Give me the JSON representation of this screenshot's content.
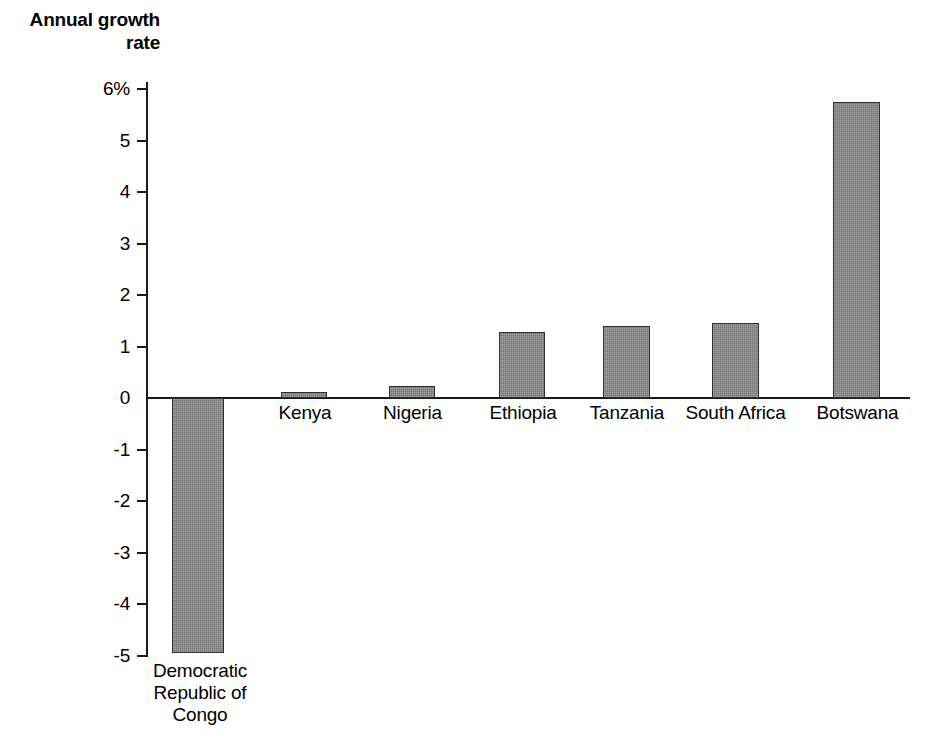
{
  "chart_data": {
    "type": "bar",
    "title": "",
    "subtitle": "",
    "ylabel": "Annual growth rate",
    "xlabel": "",
    "ylim": [
      -5,
      6
    ],
    "y_unit": "%",
    "grid": false,
    "legend": null,
    "bar_color": "#767676",
    "bar_border_color": "#2f2f2f",
    "axis_color": "#1a1a1a",
    "categories": [
      "Democratic\nRepublic of\nCongo",
      "Kenya",
      "Nigeria",
      "Ethiopia",
      "Tanzania",
      "South Africa",
      "Botswana"
    ],
    "values": [
      -4.95,
      0.12,
      0.23,
      1.28,
      1.4,
      1.45,
      5.75
    ],
    "ytick_labels": [
      "6%",
      "5",
      "4",
      "3",
      "2",
      "1",
      "0",
      "-1",
      "-2",
      "-3",
      "-4",
      "-5"
    ],
    "yticks": [
      6,
      5,
      4,
      3,
      2,
      1,
      0,
      -1,
      -2,
      -3,
      -4,
      -5
    ]
  },
  "bleed_text": "faint reverse-side print bleed-through"
}
